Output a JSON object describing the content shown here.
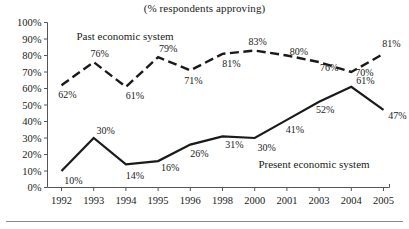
{
  "chart_data": {
    "type": "line",
    "title": "(% respondents approving)",
    "xlabel": "",
    "ylabel": "",
    "categories": [
      "1992",
      "1993",
      "1994",
      "1995",
      "1996",
      "1998",
      "2000",
      "2001",
      "2003",
      "2004",
      "2005"
    ],
    "ylim": [
      0,
      100
    ],
    "ytick_labels": [
      "0%",
      "10%",
      "20%",
      "30%",
      "40%",
      "50%",
      "60%",
      "70%",
      "80%",
      "90%",
      "100%"
    ],
    "ytick_values": [
      0,
      10,
      20,
      30,
      40,
      50,
      60,
      70,
      80,
      90,
      100
    ],
    "grid": false,
    "legend_position": "inline-annotations",
    "series": [
      {
        "name": "Past economic system",
        "style": "dashed",
        "color": "#1a1a1a",
        "values": [
          62,
          76,
          61,
          79,
          71,
          81,
          83,
          80,
          76,
          70,
          81
        ],
        "value_labels": [
          "62%",
          "76%",
          "61%",
          "79%",
          "71%",
          "81%",
          "83%",
          "80%",
          "76%",
          "70%",
          "81%"
        ]
      },
      {
        "name": "Present economic system",
        "style": "solid",
        "color": "#1a1a1a",
        "values": [
          10,
          30,
          14,
          16,
          26,
          31,
          30,
          41,
          52,
          61,
          47
        ],
        "value_labels": [
          "10%",
          "30%",
          "14%",
          "16%",
          "26%",
          "31%",
          "30%",
          "41%",
          "52%",
          "61%",
          "47%"
        ]
      }
    ],
    "annotations": [
      {
        "text": "Past economic system",
        "x_px": 125,
        "y_px": 40
      },
      {
        "text": "Present economic system",
        "x_px": 314,
        "y_px": 168
      }
    ]
  }
}
